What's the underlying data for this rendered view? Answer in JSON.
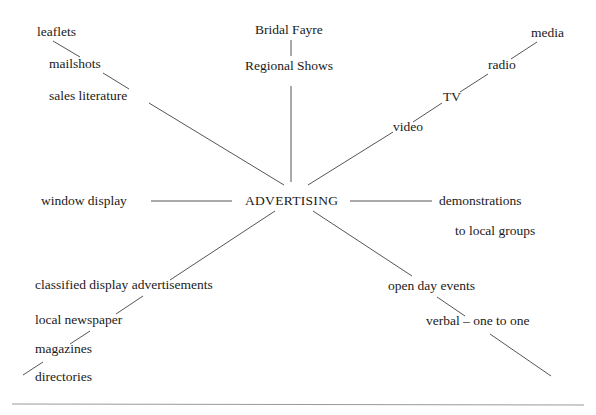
{
  "diagram": {
    "type": "spider-diagram",
    "center": {
      "label": "ADVERTISING"
    },
    "branches": [
      {
        "id": "print-mail",
        "items": [
          "leaflets",
          "mailshots",
          "sales literature"
        ]
      },
      {
        "id": "events",
        "items": [
          "Bridal Fayre",
          "Regional Shows"
        ]
      },
      {
        "id": "broadcast",
        "items": [
          "media",
          "radio",
          "TV",
          "video"
        ]
      },
      {
        "id": "display",
        "items": [
          "window display"
        ]
      },
      {
        "id": "demos",
        "items": [
          "demonstrations",
          "to local groups"
        ]
      },
      {
        "id": "press",
        "items": [
          "classified display advertisements",
          "local newspaper",
          "magazines",
          "directories"
        ]
      },
      {
        "id": "personal",
        "items": [
          "open day events",
          "verbal – one to one"
        ]
      }
    ]
  },
  "colors": {
    "line": "#555555",
    "text": "#1a1a1a",
    "rule": "#999999"
  }
}
